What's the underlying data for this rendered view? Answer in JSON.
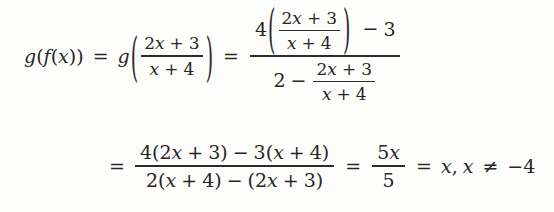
{
  "figure": {
    "kind": "math-derivation",
    "ink_color": "#262626",
    "background_color": "#fdfdfc"
  },
  "line1": {
    "lhs": {
      "g": "g",
      "open": "(",
      "f": "f",
      "open2": "(",
      "x": "x",
      "close2": ")",
      "close": ")"
    },
    "eq1": "=",
    "g_applied": "g",
    "paren_open": "(",
    "paren_close": ")",
    "inner_fraction": {
      "numerator": {
        "coef": "2",
        "var": "x",
        "op": "+",
        "const": "3"
      },
      "denominator": {
        "var": "x",
        "op": "+",
        "const": "4"
      }
    },
    "eq2": "=",
    "complex_fraction": {
      "numerator": {
        "multiplier": "4",
        "paren_open": "(",
        "paren_close": ")",
        "inner": {
          "numerator": {
            "coef": "2",
            "var": "x",
            "op": "+",
            "const": "3"
          },
          "denominator": {
            "var": "x",
            "op": "+",
            "const": "4"
          }
        },
        "op": "−",
        "trailing": "3"
      },
      "denominator": {
        "leading": "2",
        "op": "−",
        "inner": {
          "numerator": {
            "coef": "2",
            "var": "x",
            "op": "+",
            "const": "3"
          },
          "denominator": {
            "var": "x",
            "op": "+",
            "const": "4"
          }
        }
      }
    }
  },
  "line2": {
    "eq1": "=",
    "expanded_fraction": {
      "numerator": {
        "t1_coef": "4",
        "t1_open": "(",
        "t1_inner_coef": "2",
        "t1_var": "x",
        "t1_op": "+",
        "t1_const": "3",
        "t1_close": ")",
        "op": "−",
        "t2_coef": "3",
        "t2_open": "(",
        "t2_var": "x",
        "t2_op": "+",
        "t2_const": "4",
        "t2_close": ")"
      },
      "denominator": {
        "t1_coef": "2",
        "t1_open": "(",
        "t1_var": "x",
        "t1_op": "+",
        "t1_const": "4",
        "t1_close": ")",
        "op": "−",
        "t2_open": "(",
        "t2_coef": "2",
        "t2_var": "x",
        "t2_op": "+",
        "t2_const": "3",
        "t2_close": ")"
      }
    },
    "eq2": "=",
    "reduced_fraction": {
      "numerator_coef": "5",
      "numerator_var": "x",
      "denominator": "5"
    },
    "eq3": "=",
    "result": "x",
    "comma": ",",
    "domain_var": "x",
    "domain_rel": "≠",
    "domain_value": "−4"
  }
}
